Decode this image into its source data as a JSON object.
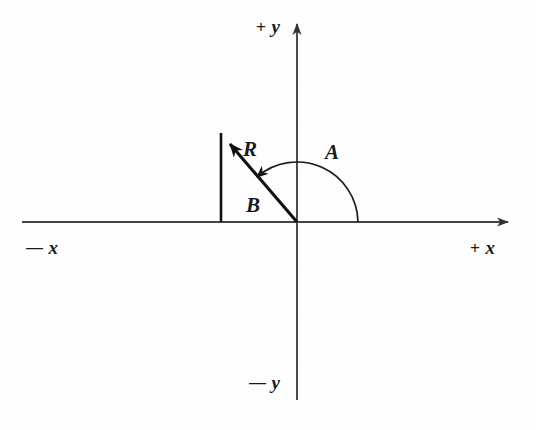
{
  "diagram": {
    "background_color": "#fefefe",
    "stroke_color": "#1a1a1a",
    "axis_color": "#444444",
    "origin": {
      "x": 297,
      "y": 222
    },
    "axes": {
      "x_axis": {
        "name": "horizontal-axis",
        "x_start": 22,
        "x_end": 516,
        "y": 222,
        "arrow_at": "right"
      },
      "y_axis": {
        "name": "vertical-axis",
        "x": 297,
        "y_start": 16,
        "y_end": 400,
        "arrow_at": "top"
      }
    },
    "axis_labels": [
      {
        "id": "plus-y",
        "sign": "+",
        "letter": "y",
        "left": 256,
        "top": 17
      },
      {
        "id": "minus-x",
        "sign": "—",
        "letter": "x",
        "left": 26,
        "top": 238
      },
      {
        "id": "plus-x",
        "sign": "+",
        "letter": "x",
        "left": 470,
        "top": 238
      },
      {
        "id": "minus-y",
        "sign": "—",
        "letter": "y",
        "left": 249,
        "top": 373
      }
    ],
    "vectors": [
      {
        "id": "resultant",
        "label": "R",
        "from": {
          "x": 297,
          "y": 222
        },
        "to": {
          "x": 221,
          "y": 133
        },
        "arrowhead": true,
        "label_left": 243,
        "label_top": 139
      },
      {
        "id": "component-b",
        "label": "B",
        "from": {
          "x": 221,
          "y": 222
        },
        "to": {
          "x": 221,
          "y": 133
        },
        "arrowhead": false,
        "label_left": 246,
        "label_top": 195
      }
    ],
    "angle": {
      "id": "angle-a",
      "label": "A",
      "radius": 61,
      "start_degrees": 0,
      "end_degrees": 131,
      "direction": "counterclockwise",
      "arrowhead_at": "end",
      "label_left": 325,
      "label_top": 142
    }
  }
}
